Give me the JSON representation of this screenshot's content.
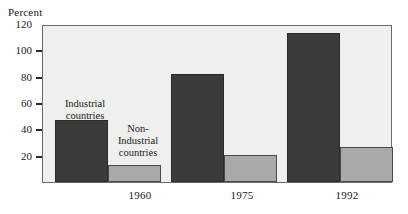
{
  "chart_data": {
    "type": "bar",
    "title": "",
    "xlabel": "",
    "ylabel": "Percent",
    "ylim": [
      0,
      120
    ],
    "yticks": [
      0,
      20,
      40,
      60,
      80,
      100,
      120
    ],
    "ytick_labels": [
      "",
      "20",
      "40",
      "60",
      "80",
      "100",
      "120"
    ],
    "grid": false,
    "legend_position": "in-plot annotations",
    "categories": [
      "1960",
      "1975",
      "1992"
    ],
    "series": [
      {
        "name": "Industrial countries",
        "color": "#3b3b3b",
        "values": [
          48,
          83,
          115
        ]
      },
      {
        "name": "Non-Industrial countries",
        "color": "#a9a9a9",
        "values": [
          13,
          21,
          27
        ]
      }
    ],
    "annotations": [
      {
        "id": "industrial",
        "lines": [
          "Industrial",
          "countries"
        ],
        "target_series": "Industrial countries"
      },
      {
        "id": "nonindustrial",
        "lines": [
          "Non-",
          "Industrial",
          "countries"
        ],
        "target_series": "Non-Industrial countries"
      }
    ]
  },
  "axis": {
    "unit_label": "Percent"
  },
  "colors": {
    "plot_background": "#efefed",
    "frame": "#6b6b6b",
    "industrial_bar": "#3b3b3b",
    "nonindustrial_bar": "#a9a9a9",
    "text": "#1a1a1a"
  }
}
